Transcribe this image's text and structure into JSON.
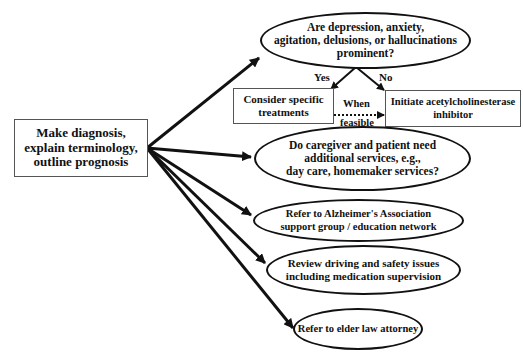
{
  "diagram": {
    "root": {
      "text": "Make diagnosis,\nexplain terminology,\noutline prognosis"
    },
    "question1": {
      "text": "Are depression, anxiety,\nagitation, delusions, or hallucinations\nprominent?"
    },
    "branch_labels": {
      "yes": "Yes",
      "no": "No",
      "when_feasible_line1": "When",
      "when_feasible_line2": "feasible"
    },
    "yes_box": {
      "text": "Consider specific\ntreatments"
    },
    "no_box": {
      "text": "Initiate acetylcholinesterase\ninhibitor"
    },
    "question2": {
      "text": "Do caregiver and patient need\nadditional services, e.g.,\nday care, homemaker services?"
    },
    "action_alzheimers": {
      "text": "Refer to Alzheimer's Association\nsupport group / education network"
    },
    "action_driving": {
      "text": "Review driving and safety issues\nincluding medication supervision"
    },
    "action_elder_law": {
      "text": "Refer to elder law attorney"
    },
    "colors": {
      "stroke": "#111111",
      "box_border": "#555555",
      "background": "#ffffff"
    }
  }
}
